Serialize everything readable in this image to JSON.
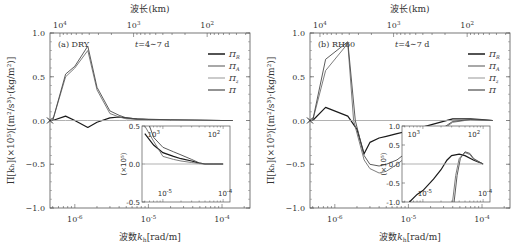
{
  "chart_data": [
    {
      "type": "line",
      "panel_label": "(a) DRY",
      "time_label": "t=4~7 d",
      "xlabel": "波数k_h[rad/m]",
      "xlabel_top": "波长(km)",
      "ylabel": "Π[k_h](×10^5)[(m²/s³)·(kg/m²)]",
      "xscale": "log",
      "xlim": [
        4.6e-07,
        0.00024
      ],
      "ylim": [
        -1.0,
        1.0
      ],
      "yticks": [
        "1.0",
        "0.5",
        "0.0",
        "-0.5",
        "-1.0"
      ],
      "xticks": [
        "10^-6",
        "10^-5",
        "10^-4"
      ],
      "xticks_top": [
        "10^4",
        "10^3",
        "10^2"
      ],
      "legend": [
        "Π_R",
        "Π_A",
        "Π_z",
        "Π"
      ],
      "legend_position": "top-right",
      "series": [
        {
          "name": "Π_R",
          "color": "#222222",
          "x": [
            5e-07,
            7.5e-07,
            1e-06,
            1.5e-06,
            2e-06,
            3e-06,
            4e-06,
            5e-06,
            7e-06,
            1e-05,
            2e-05,
            5e-05,
            0.0001,
            0.00014
          ],
          "y": [
            0.0,
            0.05,
            0.0,
            -0.08,
            -0.02,
            0.03,
            0.04,
            0.03,
            0.015,
            0.01,
            0.005,
            0.002,
            0.0,
            0.0
          ]
        },
        {
          "name": "Π_A",
          "color": "#777777",
          "x": [
            5e-07,
            7.5e-07,
            1e-06,
            1.5e-06,
            2e-06,
            3e-06,
            4e-06,
            5e-06,
            7e-06,
            1e-05,
            2e-05,
            5e-05,
            0.0001,
            0.00014
          ],
          "y": [
            0.0,
            0.5,
            0.6,
            0.8,
            0.35,
            0.08,
            0.04,
            0.02,
            0.015,
            0.01,
            0.005,
            0.002,
            0.0,
            0.0
          ]
        },
        {
          "name": "Π_z",
          "color": "#aaaaaa",
          "x": [
            5e-07,
            7.5e-07,
            1e-06,
            1.5e-06,
            2e-06,
            3e-06,
            4e-06,
            5e-06,
            7e-06,
            1e-05,
            2e-05,
            5e-05,
            0.0001,
            0.00014
          ],
          "y": [
            0.0,
            0.0,
            0.0,
            0.0,
            0.0,
            0.0,
            0.0,
            0.0,
            0.0,
            0.0,
            0.0,
            0.0,
            0.0,
            0.0
          ]
        },
        {
          "name": "Π",
          "color": "#555555",
          "x": [
            5e-07,
            7.5e-07,
            1e-06,
            1.5e-06,
            2e-06,
            3e-06,
            4e-06,
            5e-06,
            7e-06,
            1e-05,
            2e-05,
            5e-05,
            0.0001,
            0.00014
          ],
          "y": [
            0.0,
            0.53,
            0.62,
            0.85,
            0.38,
            0.11,
            0.06,
            0.03,
            0.02,
            0.015,
            0.008,
            0.003,
            0.0,
            0.0
          ]
        }
      ],
      "inset": {
        "ylabel": "(×10^5)",
        "ylim": [
          -0.5,
          0.5
        ],
        "yticks": [
          "0.5",
          "0.0",
          "-0.5"
        ],
        "xticks": [
          "10^-5",
          "10^-4"
        ],
        "xticks_top": [
          "10^3",
          "10^2"
        ],
        "series": [
          {
            "name": "Π_R",
            "x": [
              5e-06,
              7e-06,
              1e-05,
              1.5e-05,
              2e-05,
              3e-05,
              4e-05,
              5e-05,
              7e-05,
              0.0001
            ],
            "y": [
              0.4,
              0.25,
              0.15,
              0.1,
              0.07,
              0.04,
              0.01,
              0.0,
              0.0,
              0.0
            ]
          },
          {
            "name": "Π_A",
            "x": [
              5e-06,
              7e-06,
              1e-05,
              1.5e-05,
              2e-05,
              3e-05,
              4e-05,
              5e-05,
              7e-05,
              0.0001
            ],
            "y": [
              0.5,
              0.3,
              0.1,
              0.06,
              0.04,
              0.02,
              0.005,
              0.0,
              0.0,
              0.0
            ]
          },
          {
            "name": "Π_z",
            "x": [
              5e-06,
              0.0001
            ],
            "y": [
              0.0,
              0.0
            ]
          },
          {
            "name": "Π",
            "x": [
              6e-06,
              7e-06,
              1e-05,
              1.5e-05,
              2e-05,
              3e-05,
              4e-05,
              5e-05,
              7e-05,
              0.0001
            ],
            "y": [
              0.5,
              0.35,
              0.22,
              0.16,
              0.12,
              0.06,
              0.015,
              0.0,
              0.0,
              0.0
            ]
          }
        ]
      }
    },
    {
      "type": "line",
      "panel_label": "(b) RH60",
      "time_label": "t=4~7 d",
      "xlabel": "波数k_h[rad/m]",
      "xlabel_top": "波长(km)",
      "ylabel": "Π[k_h](×10^5)[(m²/s³)·(kg/m²)]",
      "xscale": "log",
      "xlim": [
        4.6e-07,
        0.00024
      ],
      "ylim": [
        -1.0,
        1.0
      ],
      "yticks": [
        "1.0",
        "0.5",
        "0.0",
        "-0.5",
        "-1.0"
      ],
      "xticks": [
        "10^-6",
        "10^-5",
        "10^-4"
      ],
      "xticks_top": [
        "10^4",
        "10^3",
        "10^2"
      ],
      "legend": [
        "Π_R",
        "Π_A",
        "Π_z",
        "Π"
      ],
      "legend_position": "top-right",
      "series": [
        {
          "name": "Π_R",
          "color": "#222222",
          "x": [
            5e-07,
            7.5e-07,
            1.5e-06,
            2e-06,
            2.5e-06,
            3e-06,
            4e-06,
            5e-06,
            7e-06,
            1e-05,
            2e-05,
            4e-05,
            7e-05,
            0.0001,
            0.00014
          ],
          "y": [
            0.0,
            0.15,
            0.05,
            -0.1,
            -0.38,
            -0.25,
            -0.2,
            -0.18,
            -0.15,
            -0.12,
            -0.05,
            0.02,
            0.02,
            0.01,
            0.0
          ]
        },
        {
          "name": "Π_A",
          "color": "#777777",
          "x": [
            5e-07,
            7.5e-07,
            1.5e-06,
            1.8e-06,
            2.5e-06,
            3e-06,
            4e-06,
            5e-06,
            7e-06,
            1e-05,
            2e-05,
            4e-05,
            7e-05,
            0.0001,
            0.00014
          ],
          "y": [
            0.0,
            0.57,
            0.88,
            0.0,
            -0.45,
            -0.55,
            -0.6,
            -0.58,
            -0.5,
            -0.4,
            -0.2,
            -0.02,
            0.01,
            0.005,
            0.0
          ]
        },
        {
          "name": "Π_z",
          "color": "#aaaaaa",
          "x": [
            5e-07,
            0.00014
          ],
          "y": [
            0.0,
            0.0
          ]
        },
        {
          "name": "Π",
          "color": "#555555",
          "x": [
            5e-07,
            7.5e-07,
            1.5e-06,
            1.9e-06,
            2.5e-06,
            3e-06,
            4e-06,
            5e-06,
            7e-06,
            1e-05,
            2e-05,
            4e-05,
            7e-05,
            0.0001,
            0.00014
          ],
          "y": [
            0.0,
            0.7,
            0.9,
            0.0,
            -0.4,
            -0.5,
            -0.52,
            -0.5,
            -0.45,
            -0.35,
            -0.18,
            -0.01,
            0.01,
            0.005,
            0.0
          ]
        }
      ],
      "inset": {
        "ylabel": "(×10^5)",
        "ylim": [
          -1.0,
          1.0
        ],
        "yticks": [
          "1.0",
          "0.5",
          "0.0",
          "-0.5",
          "-1.0"
        ],
        "xticks": [
          "10^-5",
          "10^-4"
        ],
        "xticks_top": [
          "10^3",
          "10^2"
        ],
        "series": [
          {
            "name": "Π_R",
            "x": [
              6e-06,
              8e-06,
              1e-05,
              1.5e-05,
              2e-05,
              2.5e-05,
              3e-05,
              4e-05,
              5e-05,
              7e-05,
              0.0001
            ],
            "y": [
              -1.0,
              -0.8,
              -0.7,
              -0.4,
              -0.15,
              0.1,
              0.22,
              0.26,
              0.22,
              0.1,
              0.0
            ]
          },
          {
            "name": "Π_A",
            "x": [
              3.1e-05,
              3.5e-05,
              4e-05,
              5e-05,
              6e-05,
              7e-05,
              0.0001
            ],
            "y": [
              -1.0,
              -0.3,
              0.15,
              0.3,
              0.25,
              0.12,
              0.0
            ]
          },
          {
            "name": "Π_z",
            "x": [
              5e-06,
              0.0001
            ],
            "y": [
              0.0,
              0.0
            ]
          },
          {
            "name": "Π",
            "x": [
              3.3e-05,
              3.7e-05,
              4.2e-05,
              5e-05,
              6e-05,
              7e-05,
              0.0001
            ],
            "y": [
              -1.0,
              -0.3,
              0.15,
              0.32,
              0.28,
              0.14,
              0.0
            ]
          }
        ]
      }
    }
  ]
}
